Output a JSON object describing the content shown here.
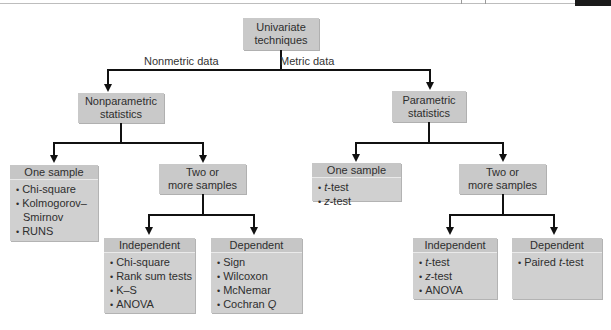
{
  "diagram": {
    "root": {
      "label_line1": "Univariate",
      "label_line2": "techniques"
    },
    "edges": {
      "left_label": "Nonmetric data",
      "right_label": "Metric data"
    },
    "nonparametric": {
      "label_line1": "Nonparametric",
      "label_line2": "statistics",
      "one_sample": {
        "header": "One sample",
        "items": [
          "Chi-square",
          "Kolmogorov–",
          "Smirnov",
          "RUNS"
        ]
      },
      "two_or_more": {
        "label_line1": "Two or",
        "label_line2": "more samples"
      },
      "independent": {
        "header": "Independent",
        "items": [
          "Chi-square",
          "Rank sum tests",
          "K–S",
          "ANOVA"
        ]
      },
      "dependent": {
        "header": "Dependent",
        "items": [
          "Sign",
          "Wilcoxon",
          "McNemar",
          "Cochran "
        ],
        "italic_suffix": "Q"
      }
    },
    "parametric": {
      "label_line1": "Parametric",
      "label_line2": "statistics",
      "one_sample": {
        "header": "One sample",
        "items_italic": [
          "t",
          "z"
        ],
        "items_suffix": "-test"
      },
      "two_or_more": {
        "label_line1": "Two or",
        "label_line2": "more samples"
      },
      "independent": {
        "header": "Independent",
        "items_italic": [
          "t",
          "z"
        ],
        "items_suffix": "-test",
        "extra_item": "ANOVA"
      },
      "dependent": {
        "header": "Dependent",
        "item_prefix": "Paired ",
        "item_italic": "t",
        "item_suffix": "-test"
      }
    }
  },
  "colors": {
    "box_fill": "#c9c9c9",
    "line": "#111111"
  }
}
